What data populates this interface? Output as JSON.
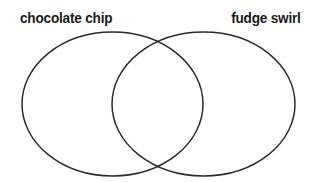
{
  "diagram": {
    "type": "venn",
    "title": "",
    "background_color": "#ffffff",
    "stroke_color": "#2b2b2b",
    "stroke_width": 1.5,
    "fill": "none",
    "sets": [
      {
        "id": "left",
        "label": "chocolate chip",
        "label_color": "#1a1a1a",
        "cx": 112.5,
        "cy": 104,
        "rx": 90.5,
        "ry": 72
      },
      {
        "id": "right",
        "label": "fudge swirl",
        "label_color": "#1a1a1a",
        "cx": 203.5,
        "cy": 104,
        "rx": 91.5,
        "ry": 72
      }
    ],
    "regions": {
      "left_only_text": "",
      "overlap_text": "",
      "right_only_text": ""
    }
  }
}
